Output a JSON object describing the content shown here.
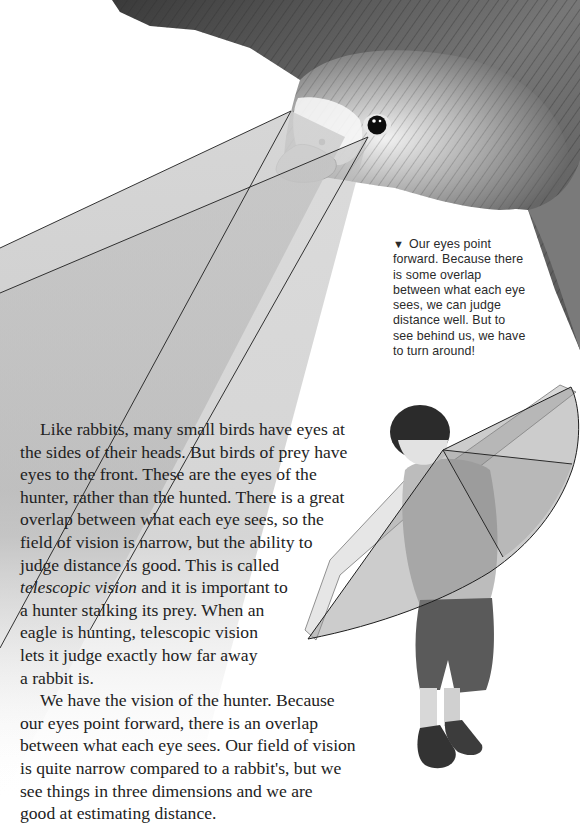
{
  "caption": {
    "marker": "▼",
    "lines": [
      "Our eyes point",
      "forward. Because there",
      "is some overlap",
      "between what each eye",
      "sees, we can judge",
      "distance well. But to",
      "see behind us, we have",
      "to turn around!"
    ]
  },
  "body": {
    "paragraph1": {
      "line1": "Like rabbits, many small birds have eyes at",
      "line2": "the sides of their heads. But birds of prey have",
      "line3": "eyes to the front. These are the eyes of the",
      "line4": "hunter, rather than the hunted. There is a great",
      "line5": "overlap between what each eye sees, so the",
      "line6": "field of vision is narrow, but the ability to",
      "line7": "judge distance is good. This is called",
      "line8_term": "telescopic vision",
      "line8_rest": " and it is important to",
      "line9": "a hunter stalking its prey. When an",
      "line10": "eagle is hunting, telescopic vision",
      "line11": "lets it judge exactly how far away",
      "line12": "a rabbit is."
    },
    "paragraph2": {
      "line1": "We have the vision of the hunter. Because",
      "line2": "our eyes point forward, there is an overlap",
      "line3": "between what each eye sees. Our field of vision",
      "line4": "is quite narrow compared to a rabbit's, but we",
      "line5": "see things in three dimensions and we are",
      "line6": "good at estimating distance."
    }
  },
  "illustrations": {
    "bird": "bird-of-prey-head",
    "boy": "boy-with-arms-outstretched",
    "bird_vision_cone_color": "#9a9a9a",
    "boy_vision_fan_color": "#8e8e8e"
  }
}
